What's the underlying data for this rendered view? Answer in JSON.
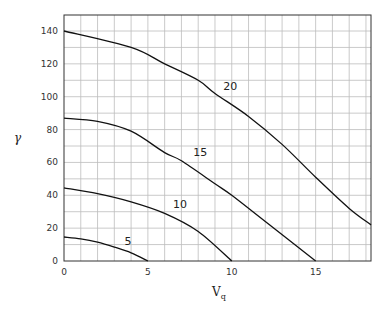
{
  "chart_data": {
    "type": "line",
    "title": "",
    "xlabel": "V",
    "xlabel_subscript": "q",
    "ylabel": "γ",
    "xlim": [
      0,
      18.3
    ],
    "ylim": [
      0,
      150
    ],
    "grid": true,
    "grid_x_step": 1,
    "grid_y_step": 10,
    "legend": "none (curves labeled inline)",
    "x_ticks": [
      0,
      5,
      10,
      15
    ],
    "x_tick_labels": [
      "0",
      "5",
      "10",
      "15"
    ],
    "y_ticks": [
      0,
      20,
      40,
      60,
      80,
      100,
      120,
      140
    ],
    "y_tick_labels": [
      "0",
      "20",
      "40",
      "60",
      "80",
      "100",
      "120",
      "140"
    ],
    "series": [
      {
        "name": "5",
        "label_at": [
          3.6,
          10
        ],
        "x": [
          0,
          1,
          2,
          3,
          4,
          5
        ],
        "y": [
          14.6,
          13.5,
          11.5,
          8.5,
          5,
          0
        ]
      },
      {
        "name": "10",
        "label_at": [
          6.5,
          32
        ],
        "x": [
          0,
          2,
          4,
          6,
          8,
          10
        ],
        "y": [
          44.5,
          41,
          36,
          29,
          18,
          0
        ]
      },
      {
        "name": "15",
        "label_at": [
          7.7,
          64
        ],
        "x": [
          0,
          2,
          4,
          6,
          7,
          9,
          10,
          12,
          15
        ],
        "y": [
          87,
          85,
          79,
          66,
          61,
          47,
          40,
          24,
          0
        ]
      },
      {
        "name": "20",
        "label_at": [
          9.5,
          104
        ],
        "x": [
          0,
          4,
          6,
          8,
          9,
          11,
          13,
          15,
          17,
          18.3
        ],
        "y": [
          140,
          130,
          120,
          110,
          102,
          88,
          71,
          51,
          32,
          22
        ]
      }
    ]
  },
  "ui": {
    "line_color": "#111111",
    "grid_color": "#bdbdbd",
    "frame_color": "#333333"
  }
}
